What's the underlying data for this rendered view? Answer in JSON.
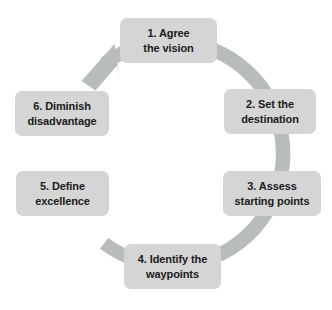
{
  "diagram": {
    "type": "cycle",
    "direction": "clockwise",
    "colors": {
      "ring": "#b9bcbd",
      "box_fill": "#d5d5d5",
      "text": "#1b1b1b",
      "background": "#ffffff"
    },
    "ring": {
      "center_x": 163,
      "center_y": 153,
      "outer_radius": 119,
      "inner_radius": 105,
      "arrow_position": "top-left",
      "arrow_direction": "clockwise"
    },
    "steps": [
      {
        "number": "1",
        "line1": "1. Agree",
        "line2": "the vision",
        "x": 120,
        "y": 18,
        "w": 97,
        "h": 45
      },
      {
        "number": "2",
        "line1": "2. Set the",
        "line2": "destination",
        "x": 224,
        "y": 89,
        "w": 92,
        "h": 45
      },
      {
        "number": "3",
        "line1": "3. Assess",
        "line2": "starting points",
        "x": 223,
        "y": 171,
        "w": 98,
        "h": 45
      },
      {
        "number": "4",
        "line1": "4. Identify the",
        "line2": "waypoints",
        "x": 124,
        "y": 244,
        "w": 97,
        "h": 45
      },
      {
        "number": "5",
        "line1": "5. Define",
        "line2": "excellence",
        "x": 16,
        "y": 171,
        "w": 93,
        "h": 45
      },
      {
        "number": "6",
        "line1": "6. Diminish",
        "line2": "disadvantage",
        "x": 15,
        "y": 91,
        "w": 94,
        "h": 45
      }
    ]
  }
}
